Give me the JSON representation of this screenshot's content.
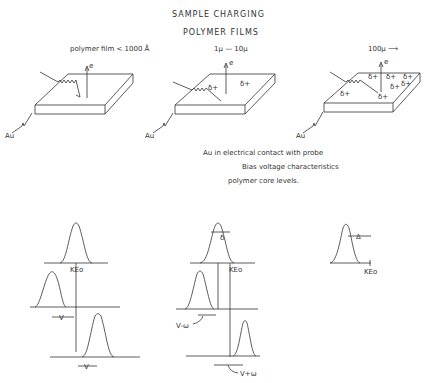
{
  "title": "SAMPLE CHARGING",
  "subtitle": "POLYMER FILMS",
  "panels": [
    {
      "thickness_label": "polymer film < 1000 Å",
      "electrode_label": "Au",
      "electron_label": "e",
      "charges": []
    },
    {
      "thickness_label": "1μ — 10μ",
      "electrode_label": "Au",
      "electron_label": "e",
      "charges": [
        "δ+",
        "δ+"
      ]
    },
    {
      "thickness_label": "100μ ⟶",
      "electrode_label": "Au",
      "electron_label": "e",
      "charges": [
        "δ+",
        "δ+",
        "δ+",
        "δ+",
        "δ+",
        "δ+",
        "δ+",
        "δ+"
      ]
    }
  ],
  "notes": [
    "Au in electrical contact with probe",
    "Bias voltage characteristics",
    "polymer core levels."
  ],
  "spectra": {
    "left": {
      "ref_label": "KEo",
      "shift_labels": [
        "V",
        "V"
      ]
    },
    "middle": {
      "delta_label": "δ",
      "ref_label": "KEo",
      "shift_labels": [
        "V-ω",
        "V+ω"
      ]
    },
    "right": {
      "delta_label": "Δ",
      "ref_label": "KEo"
    }
  },
  "colors": {
    "ink": "#333333",
    "background": "#ffffff"
  }
}
